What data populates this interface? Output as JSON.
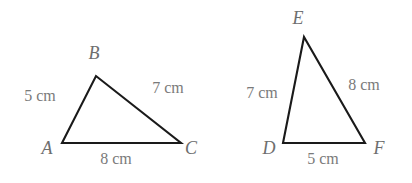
{
  "figure": {
    "background_color": "#ffffff",
    "stroke_color": "#1a1a1a",
    "label_color": "#6e6e6e",
    "measure_color": "#7a7a7a"
  },
  "triangles": [
    {
      "id": "triangle-abc",
      "name": "Triangle ABC",
      "vertices": [
        {
          "name": "A",
          "label": "A",
          "x": 62,
          "y": 143,
          "label_x": 47,
          "label_y": 148
        },
        {
          "name": "B",
          "label": "B",
          "x": 96,
          "y": 76,
          "label_x": 94,
          "label_y": 53
        },
        {
          "name": "C",
          "label": "C",
          "x": 181,
          "y": 143,
          "label_x": 191,
          "label_y": 148
        }
      ],
      "sides": [
        {
          "name": "AB",
          "label": "5 cm",
          "value": 5,
          "unit": "cm",
          "label_x": 40,
          "label_y": 96
        },
        {
          "name": "BC",
          "label": "7 cm",
          "value": 7,
          "unit": "cm",
          "label_x": 168,
          "label_y": 88
        },
        {
          "name": "AC",
          "label": "8 cm",
          "value": 8,
          "unit": "cm",
          "label_x": 116,
          "label_y": 159
        }
      ]
    },
    {
      "id": "triangle-def",
      "name": "Triangle DEF",
      "vertices": [
        {
          "name": "D",
          "label": "D",
          "x": 283,
          "y": 143,
          "label_x": 269,
          "label_y": 148
        },
        {
          "name": "E",
          "label": "E",
          "x": 304,
          "y": 37,
          "label_x": 298,
          "label_y": 18
        },
        {
          "name": "F",
          "label": "F",
          "x": 365,
          "y": 143,
          "label_x": 379,
          "label_y": 148
        }
      ],
      "sides": [
        {
          "name": "DE",
          "label": "7 cm",
          "value": 7,
          "unit": "cm",
          "label_x": 262,
          "label_y": 93
        },
        {
          "name": "EF",
          "label": "8 cm",
          "value": 8,
          "unit": "cm",
          "label_x": 364,
          "label_y": 85
        },
        {
          "name": "DF",
          "label": "5 cm",
          "value": 5,
          "unit": "cm",
          "label_x": 323,
          "label_y": 159
        }
      ]
    }
  ]
}
